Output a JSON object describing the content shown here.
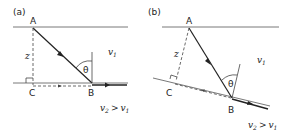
{
  "panels": [
    {
      "id": "a",
      "label": "(a)",
      "points": {
        "A": "A",
        "B": "B",
        "C": "C"
      },
      "depth_label": "z",
      "angle_label": "θ",
      "layer1_velocity": "v",
      "layer1_sub": "1",
      "relation": {
        "lhs": "v",
        "lhs_sub": "2",
        "op": ">",
        "rhs": "v",
        "rhs_sub": "1"
      }
    },
    {
      "id": "b",
      "label": "(b)",
      "points": {
        "A": "A",
        "B": "B",
        "C": "C"
      },
      "depth_label": "z",
      "angle_label": "θ",
      "layer1_velocity": "v",
      "layer1_sub": "1",
      "relation": {
        "lhs": "v",
        "lhs_sub": "2",
        "op": ">",
        "rhs": "v",
        "rhs_sub": "1"
      }
    }
  ],
  "colors": {
    "line": "#222222",
    "light_line": "#555555"
  }
}
